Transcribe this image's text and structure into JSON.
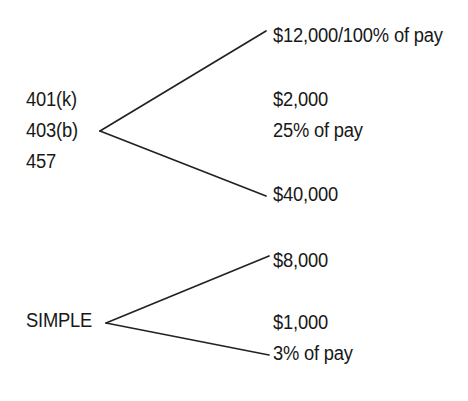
{
  "diagram": {
    "type": "bracket-tree",
    "background_color": "#ffffff",
    "line_color": "#222222",
    "text_color": "#181818",
    "groups": [
      {
        "id": "employer-plans",
        "sources": [
          "401(k)",
          "403(b)",
          "457"
        ],
        "vertex": {
          "x": 100,
          "y": 131
        },
        "branches": [
          {
            "label": "$12,000/100% of pay",
            "end": {
              "x": 266,
              "y": 31
            }
          },
          {
            "label": "$40,000",
            "end": {
              "x": 266,
              "y": 196
            }
          }
        ],
        "middle_labels": [
          "$2,000",
          "25% of pay"
        ]
      },
      {
        "id": "simple-plan",
        "sources": [
          "SIMPLE"
        ],
        "vertex": {
          "x": 106,
          "y": 323
        },
        "branches": [
          {
            "label": "$8,000",
            "end": {
              "x": 269,
              "y": 256
            }
          },
          {
            "label": "3% of pay",
            "end": {
              "x": 269,
              "y": 355
            }
          }
        ],
        "middle_labels": [
          "$1,000"
        ]
      }
    ],
    "labels": {
      "plan_401k": "401(k)",
      "plan_403b": "403(b)",
      "plan_457": "457",
      "plan_simple": "SIMPLE",
      "limit_12000": "$12,000/100% of pay",
      "limit_2000": "$2,000",
      "limit_25pct": "25% of pay",
      "limit_40000": "$40,000",
      "limit_8000": "$8,000",
      "limit_1000": "$1,000",
      "limit_3pct": "3% of pay"
    }
  }
}
